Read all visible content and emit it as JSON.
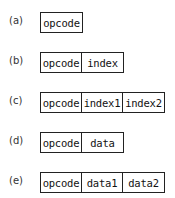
{
  "formats": [
    {
      "label": "(a)",
      "fields": [
        "opcode"
      ]
    },
    {
      "label": "(b)",
      "fields": [
        "opcode",
        "index"
      ]
    },
    {
      "label": "(c)",
      "fields": [
        "opcode",
        "index1",
        "index2"
      ]
    },
    {
      "label": "(d)",
      "fields": [
        "opcode",
        "data"
      ]
    },
    {
      "label": "(e)",
      "fields": [
        "opcode",
        "data1",
        "data2"
      ]
    }
  ]
}
